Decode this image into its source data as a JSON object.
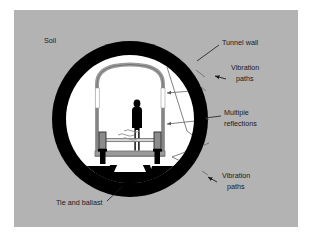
{
  "figure": {
    "panel_background": "#b3b3b3",
    "page_background": "#ffffff",
    "soil_color": "#b3b3b3",
    "tunnel_wall_color": "#000000",
    "tunnel_interior_color": "#ffffff",
    "lining_color": "#9a9a9a",
    "lining_edge_color": "#6e6e6e",
    "window_color": "#ffffff",
    "ballast_color": "#000000",
    "person_color": "#000000",
    "arrow_color": "#595959",
    "leader_color": "#1a1a1a"
  },
  "labels": {
    "soil": "Soil",
    "tunnel_wall": "Tunnel wall",
    "vibration_paths_top_line1": "Vibration",
    "vibration_paths_top_line2": "paths",
    "multiple_reflections_line1": "Multiple",
    "multiple_reflections_line2": "reflections",
    "vibration_paths_bottom_line1": "Vibration",
    "vibration_paths_bottom_line2": "paths",
    "tie_and_ballast": "Tie and ballast"
  },
  "geometry": {
    "panel": {
      "x": 14,
      "y": 10,
      "w": 284,
      "h": 217
    },
    "tunnel_center": {
      "cx": 130,
      "cy": 119
    },
    "tunnel_outer_radius": 78,
    "tunnel_inner_radius": 64,
    "person": {
      "x": 137,
      "y": 100,
      "h": 48
    }
  },
  "annotations": [
    {
      "name": "soil",
      "text_x": 44,
      "text_y": 43
    },
    {
      "name": "tunnel-wall",
      "text_x": 222,
      "text_y": 43,
      "leader_from": [
        219,
        45
      ],
      "leader_to": [
        196,
        60
      ]
    },
    {
      "name": "vibration-paths-top",
      "text_x": 222,
      "text_y": 68,
      "leader_from": [
        219,
        78
      ],
      "leader_to": [
        208,
        75
      ]
    },
    {
      "name": "multiple-reflections",
      "text_x": 236,
      "text_y": 116,
      "leader_from": [
        233,
        119
      ],
      "leader_to": [
        210,
        119
      ]
    },
    {
      "name": "vibration-paths-bottom",
      "text_x": 222,
      "text_y": 178,
      "leader_from": [
        219,
        181
      ],
      "leader_to": [
        205,
        174
      ]
    },
    {
      "name": "tie-and-ballast",
      "text_x": 56,
      "text_y": 207,
      "leader_from": [
        108,
        202
      ],
      "leader_to": [
        123,
        186
      ]
    }
  ],
  "vibration_arrows": [
    {
      "from": [
        204,
        76
      ],
      "to": [
        167,
        64
      ],
      "note": "wall to lining upper-right"
    },
    {
      "from": [
        167,
        64
      ],
      "to": [
        202,
        86
      ],
      "note": "lining to wall reflected"
    },
    {
      "from": [
        205,
        90
      ],
      "to": [
        160,
        92
      ],
      "note": "reflection into interior upper"
    },
    {
      "from": [
        206,
        120
      ],
      "to": [
        200,
        96
      ],
      "note": "wall internal reflection up"
    },
    {
      "from": [
        206,
        120
      ],
      "to": [
        160,
        124
      ],
      "note": "reflection into interior lower"
    },
    {
      "from": [
        200,
        140
      ],
      "to": [
        207,
        122
      ],
      "note": "wall internal reflection"
    },
    {
      "from": [
        172,
        158
      ],
      "to": [
        206,
        145
      ],
      "note": "source to wall lower"
    },
    {
      "from": [
        172,
        158
      ],
      "to": [
        203,
        172
      ],
      "note": "source to wall lower-right"
    },
    {
      "from": [
        166,
        66
      ],
      "to": [
        186,
        132
      ],
      "note": "long internal diagonal"
    }
  ]
}
